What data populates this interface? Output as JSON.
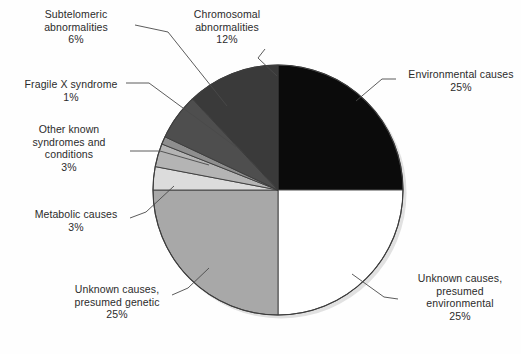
{
  "chart_data": {
    "type": "pie",
    "title": "",
    "subtitle": "",
    "xlabel": "",
    "ylabel": "",
    "legend_position": "none",
    "grid": false,
    "units": "percent",
    "total": 100,
    "start_angle_deg": 0,
    "direction": "clockwise",
    "center": {
      "x": 278,
      "y": 190
    },
    "radius": 125,
    "slices": [
      {
        "id": "environmental-causes",
        "label": "Environmental causes",
        "value": 25,
        "value_text": "25%",
        "color": "#0b0b0b",
        "start_deg": 0,
        "end_deg": 90,
        "label_lines": [
          "Environmental causes",
          "25%"
        ],
        "label_align": "left"
      },
      {
        "id": "unknown-presumed-environmental",
        "label": "Unknown causes, presumed environmental",
        "value": 25,
        "value_text": "25%",
        "color": "#ffffff",
        "start_deg": 90,
        "end_deg": 180,
        "label_lines": [
          "Unknown causes,",
          "presumed",
          "environmental",
          "25%"
        ],
        "label_align": "center"
      },
      {
        "id": "unknown-presumed-genetic",
        "label": "Unknown causes, presumed genetic",
        "value": 25,
        "value_text": "25%",
        "color": "#a8a8a8",
        "start_deg": 180,
        "end_deg": 270,
        "label_lines": [
          "Unknown causes,",
          "presumed genetic",
          "25%"
        ],
        "label_align": "center"
      },
      {
        "id": "metabolic-causes",
        "label": "Metabolic causes",
        "value": 3,
        "value_text": "3%",
        "color": "#dcdcdc",
        "start_deg": 270,
        "end_deg": 280.8,
        "label_lines": [
          "Metabolic causes",
          "3%"
        ],
        "label_align": "center"
      },
      {
        "id": "other-known-syndromes",
        "label": "Other known syndromes and conditions",
        "value": 3,
        "value_text": "3%",
        "color": "#b4b4b4",
        "start_deg": 280.8,
        "end_deg": 291.6,
        "label_lines": [
          "Other known",
          "syndromes and",
          "conditions",
          "3%"
        ],
        "label_align": "center"
      },
      {
        "id": "fragile-x-syndrome",
        "label": "Fragile X syndrome",
        "value": 1,
        "value_text": "1%",
        "color": "#8e8e8e",
        "start_deg": 291.6,
        "end_deg": 295.2,
        "label_lines": [
          "Fragile X syndrome",
          "1%"
        ],
        "label_align": "center"
      },
      {
        "id": "subtelomeric-abnormalities",
        "label": "Subtelomeric abnormalities",
        "value": 6,
        "value_text": "6%",
        "color": "#4e4e4e",
        "start_deg": 295.2,
        "end_deg": 316.8,
        "label_lines": [
          "Subtelomeric",
          "abnormalities",
          "6%"
        ],
        "label_align": "center"
      },
      {
        "id": "chromosomal-abnormalities",
        "label": "Chromosomal abnormalities",
        "value": 12,
        "value_text": "12%",
        "color": "#3a3a3a",
        "start_deg": 316.8,
        "end_deg": 360,
        "label_lines": [
          "Chromosomal",
          "abnormalities",
          "12%"
        ],
        "label_align": "center"
      }
    ],
    "categories": [
      "Environmental causes",
      "Unknown causes, presumed environmental",
      "Unknown causes, presumed genetic",
      "Metabolic causes",
      "Other known syndromes and conditions",
      "Fragile X syndrome",
      "Subtelomeric abnormalities",
      "Chromosomal abnormalities"
    ],
    "values": [
      25,
      25,
      25,
      3,
      3,
      1,
      6,
      12
    ]
  },
  "labels": {
    "subtelomeric": {
      "line1": "Subtelomeric",
      "line2": "abnormalities",
      "line3": "6%"
    },
    "chromosomal": {
      "line1": "Chromosomal",
      "line2": "abnormalities",
      "line3": "12%"
    },
    "fragilex": {
      "line1": "Fragile X syndrome",
      "line2": "1%"
    },
    "otherknown": {
      "line1": "Other known",
      "line2": "syndromes and",
      "line3": "conditions",
      "line4": "3%"
    },
    "metabolic": {
      "line1": "Metabolic causes",
      "line2": "3%"
    },
    "unknown_genetic": {
      "line1": "Unknown causes,",
      "line2": "presumed genetic",
      "line3": "25%"
    },
    "unknown_environmental": {
      "line1": "Unknown causes,",
      "line2": "presumed",
      "line3": "environmental",
      "line4": "25%"
    },
    "environmental": {
      "line1": "Environmental causes",
      "line2": "25%"
    }
  },
  "colors": {
    "background": "#fefefe",
    "outline": "#3c3c3c",
    "leader_line": "#4a4a4a",
    "text": "#2b2b2b",
    "environmental": "#0b0b0b",
    "unknown_environmental": "#ffffff",
    "unknown_genetic": "#a8a8a8",
    "metabolic": "#dcdcdc",
    "other_known": "#b4b4b4",
    "fragile_x": "#8e8e8e",
    "subtelomeric": "#4e4e4e",
    "chromosomal": "#3a3a3a"
  }
}
